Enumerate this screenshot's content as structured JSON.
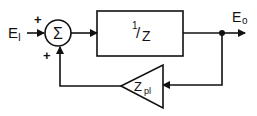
{
  "diagram": {
    "type": "block-diagram",
    "colors": {
      "stroke": "#111111",
      "background": "#ffffff"
    },
    "input": {
      "label_main": "E",
      "label_sub": "I",
      "suffix": "—"
    },
    "summer": {
      "symbol": "Σ",
      "input_sign_top": "+",
      "input_sign_bottom": "+"
    },
    "forward_block": {
      "numerator": "1",
      "slash": "/",
      "denominator": "Z"
    },
    "output": {
      "label_main": "E",
      "label_sub": "o"
    },
    "feedback_block": {
      "label_main": "Z",
      "label_sub": "pl"
    }
  }
}
